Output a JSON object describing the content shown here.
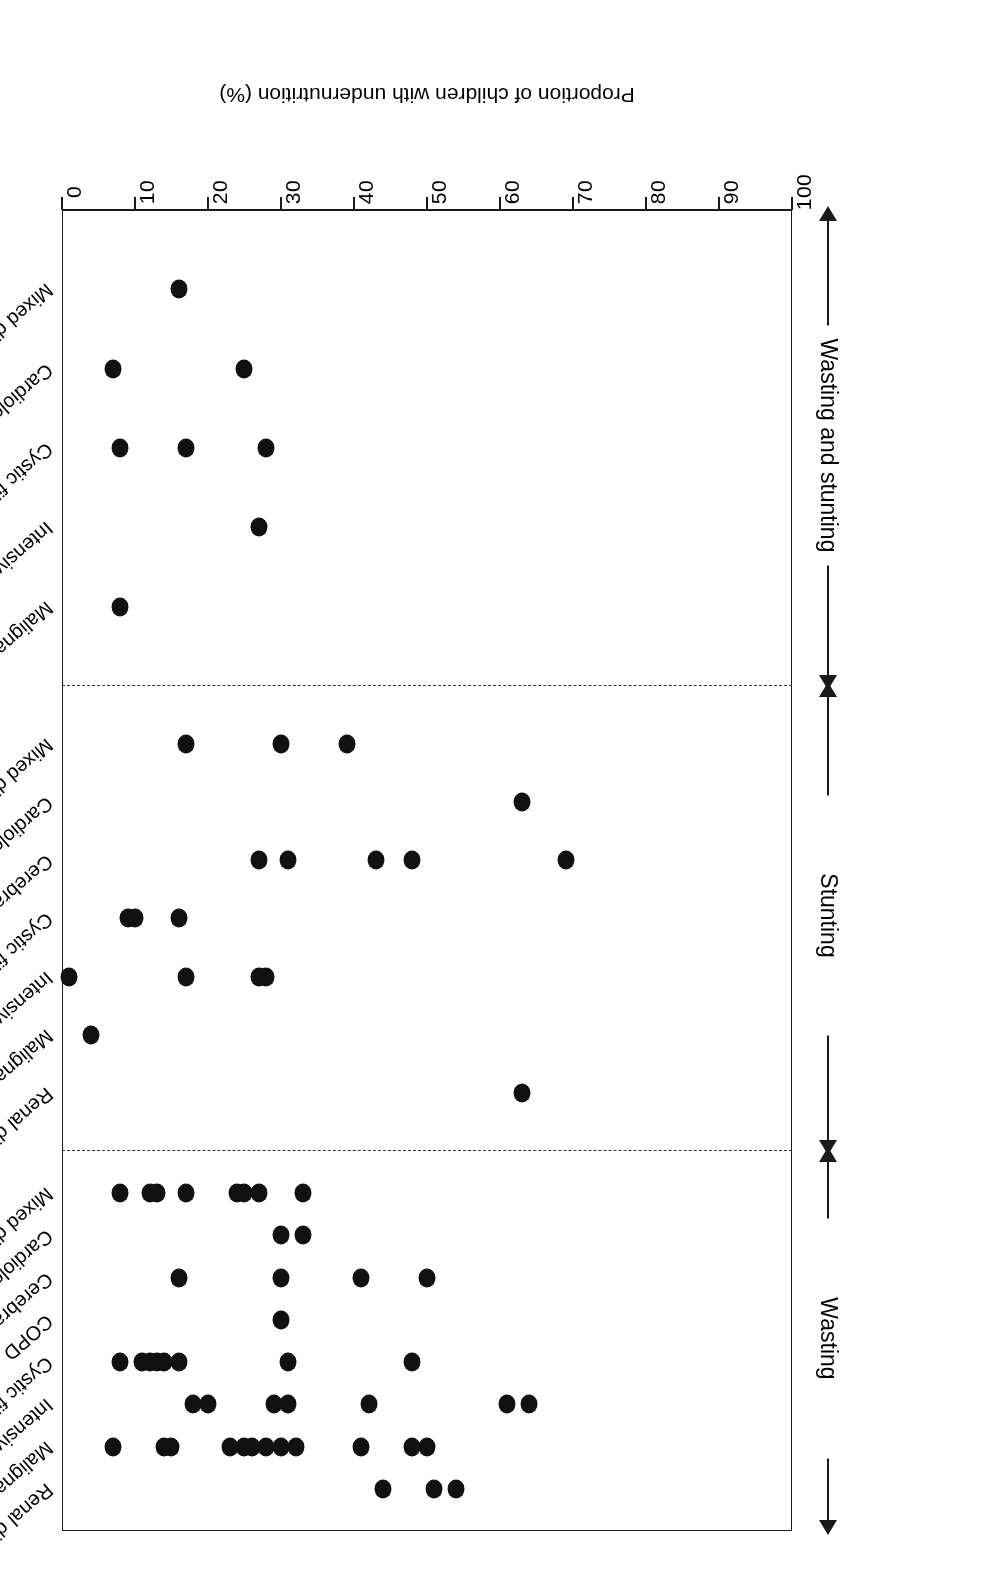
{
  "figure": {
    "orientation_note": "rotated-180",
    "axis_title": "Proportion of children with undernutrition (%)",
    "axis_ticks": [
      "100",
      "90",
      "80",
      "70",
      "60",
      "50",
      "40",
      "30",
      "20",
      "10",
      "0"
    ]
  },
  "chart_data": {
    "type": "scatter",
    "title": "",
    "xlabel": "",
    "ylabel": "Proportion of children with undernutrition (%)",
    "ylim": [
      0,
      100
    ],
    "grid": false,
    "legend": "none",
    "orientation": "horizontal-dot-strip",
    "axis_tick_values": [
      100,
      90,
      80,
      70,
      60,
      50,
      40,
      30,
      20,
      10,
      0
    ],
    "panels": [
      {
        "name": "Wasting",
        "categories": [
          {
            "label": "Renal disease",
            "values": [
              54,
              51,
              44
            ]
          },
          {
            "label": "Malignancy",
            "values": [
              50,
              48,
              41,
              32,
              30,
              28,
              26,
              25,
              23,
              15,
              14,
              7
            ]
          },
          {
            "label": "Intensive care",
            "values": [
              64,
              61,
              42,
              31,
              29,
              20,
              18
            ]
          },
          {
            "label": "Cystic fibrosis",
            "values": [
              48,
              31,
              16,
              14,
              13,
              12,
              11,
              8
            ]
          },
          {
            "label": "COPD",
            "values": [
              30
            ]
          },
          {
            "label": "Cerebral palsy",
            "values": [
              50,
              41,
              30,
              16
            ]
          },
          {
            "label": "Cardiology",
            "values": [
              33,
              30
            ]
          },
          {
            "label": "Mixed diagnoses",
            "values": [
              33,
              27,
              25,
              24,
              17,
              13,
              12,
              8
            ]
          }
        ]
      },
      {
        "name": "Stunting",
        "categories": [
          {
            "label": "Renal disease",
            "values": [
              63
            ]
          },
          {
            "label": "Malignancy",
            "values": [
              4
            ]
          },
          {
            "label": "Intensive care",
            "values": [
              28,
              27,
              17,
              1
            ]
          },
          {
            "label": "Cystic fibrosis",
            "values": [
              16,
              10,
              9
            ]
          },
          {
            "label": "Cerebral palsy",
            "values": [
              69,
              48,
              43,
              31,
              27
            ]
          },
          {
            "label": "Cardiology",
            "values": [
              63
            ]
          },
          {
            "label": "Mixed diagnoses",
            "values": [
              39,
              30,
              17
            ]
          }
        ]
      },
      {
        "name": "Wasting and stunting",
        "categories": [
          {
            "label": "Malignancy",
            "values": [
              8
            ]
          },
          {
            "label": "Intensive care",
            "values": [
              27
            ]
          },
          {
            "label": "Cystic fibrosis",
            "values": [
              28,
              17,
              8
            ]
          },
          {
            "label": "Cardiology",
            "values": [
              25,
              7
            ]
          },
          {
            "label": "Mixed diagnoses",
            "values": [
              16
            ]
          }
        ]
      }
    ]
  }
}
